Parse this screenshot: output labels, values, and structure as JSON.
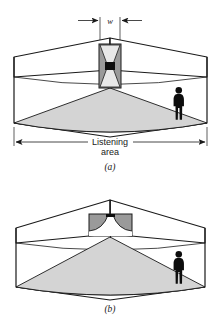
{
  "figure": {
    "kind": "loudspeaker-coverage-diagram",
    "background_color": "#ffffff",
    "line_color": "#1a1a1a",
    "coverage_fill": "#d4d4d4",
    "speaker_body_fill": "#9a9a9a",
    "speaker_throat_fill": "#ffffff",
    "person_fill": "#0d0d0d"
  },
  "panel_a": {
    "caption": "(a)",
    "dimension": {
      "label": "w",
      "style": "inward-arrows",
      "measures": "speaker cabinet width"
    },
    "coverage_label": {
      "line1": "Listening",
      "line2": "area"
    },
    "coverage_dimension": {
      "style": "double-headed-arrow",
      "spans": "full room width"
    },
    "speaker": {
      "type": "narrow-vertical-horn",
      "orientation": "vertical",
      "throat_shape": "hourglass",
      "driver": "dark-square"
    },
    "listener": {
      "type": "standing-person-silhouette",
      "count": 1,
      "position": "right side of listening area"
    }
  },
  "panel_b": {
    "caption": "(b)",
    "speaker": {
      "type": "wide-horizontal-horn",
      "orientation": "horizontal",
      "throat_shape": "flared-bell",
      "driver": "dark-notch"
    },
    "listener": {
      "type": "standing-person-silhouette",
      "count": 1,
      "position": "right side of listening area"
    }
  }
}
